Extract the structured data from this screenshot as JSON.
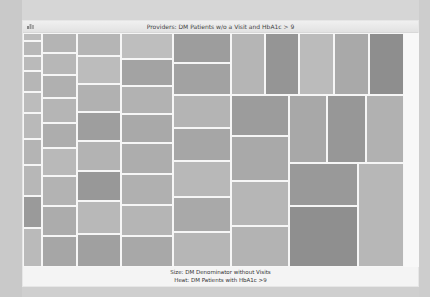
{
  "window": {
    "title": "Providers: DM Patients w/o a Visit and HbA1c > 9",
    "icon": "chart-window-icon"
  },
  "caption": {
    "size_label": "Size: DM Denominator without Visits",
    "heat_label": "Heat: DM Patients with HbA1c >9"
  },
  "chart_data": {
    "type": "heatmap",
    "subtype": "treemap",
    "title": "Providers: DM Patients w/o a Visit and HbA1c > 9",
    "size_measure": "DM Denominator without Visits",
    "color_measure": "DM Patients with HbA1c >9",
    "color_scale": "grayscale (darker = higher)",
    "legend": "none",
    "grid": false,
    "tiles": [
      {
        "x": 0,
        "y": 0,
        "w": 19,
        "h": 8,
        "c": "#bdbdbd"
      },
      {
        "x": 0,
        "y": 8,
        "w": 19,
        "h": 15,
        "c": "#b8b8b8"
      },
      {
        "x": 0,
        "y": 23,
        "w": 19,
        "h": 15,
        "c": "#bababa"
      },
      {
        "x": 0,
        "y": 38,
        "w": 19,
        "h": 21,
        "c": "#b6b6b6"
      },
      {
        "x": 0,
        "y": 59,
        "w": 19,
        "h": 21,
        "c": "#bcbcbc"
      },
      {
        "x": 0,
        "y": 80,
        "w": 19,
        "h": 26,
        "c": "#b9b9b9"
      },
      {
        "x": 0,
        "y": 106,
        "w": 19,
        "h": 26,
        "c": "#b4b4b4"
      },
      {
        "x": 0,
        "y": 132,
        "w": 19,
        "h": 31,
        "c": "#b7b7b7"
      },
      {
        "x": 0,
        "y": 163,
        "w": 19,
        "h": 32,
        "c": "#9a9a9a"
      },
      {
        "x": 0,
        "y": 195,
        "w": 19,
        "h": 39,
        "c": "#bababa"
      },
      {
        "x": 19,
        "y": 0,
        "w": 35,
        "h": 20,
        "c": "#b4b4b4"
      },
      {
        "x": 19,
        "y": 20,
        "w": 35,
        "h": 22,
        "c": "#b7b7b7"
      },
      {
        "x": 19,
        "y": 42,
        "w": 35,
        "h": 23,
        "c": "#b0b0b0"
      },
      {
        "x": 19,
        "y": 65,
        "w": 35,
        "h": 25,
        "c": "#b5b5b5"
      },
      {
        "x": 19,
        "y": 90,
        "w": 35,
        "h": 25,
        "c": "#adadad"
      },
      {
        "x": 19,
        "y": 115,
        "w": 35,
        "h": 28,
        "c": "#b9b9b9"
      },
      {
        "x": 19,
        "y": 143,
        "w": 35,
        "h": 30,
        "c": "#b3b3b3"
      },
      {
        "x": 19,
        "y": 173,
        "w": 35,
        "h": 30,
        "c": "#acacac"
      },
      {
        "x": 19,
        "y": 203,
        "w": 35,
        "h": 31,
        "c": "#a6a6a6"
      },
      {
        "x": 54,
        "y": 0,
        "w": 44,
        "h": 23,
        "c": "#b5b5b5"
      },
      {
        "x": 54,
        "y": 23,
        "w": 44,
        "h": 28,
        "c": "#bcbcbc"
      },
      {
        "x": 54,
        "y": 51,
        "w": 44,
        "h": 28,
        "c": "#b1b1b1"
      },
      {
        "x": 54,
        "y": 79,
        "w": 44,
        "h": 29,
        "c": "#9e9e9e"
      },
      {
        "x": 54,
        "y": 108,
        "w": 44,
        "h": 30,
        "c": "#b3b3b3"
      },
      {
        "x": 54,
        "y": 138,
        "w": 44,
        "h": 30,
        "c": "#989898"
      },
      {
        "x": 54,
        "y": 168,
        "w": 44,
        "h": 33,
        "c": "#b8b8b8"
      },
      {
        "x": 54,
        "y": 201,
        "w": 44,
        "h": 33,
        "c": "#a0a0a0"
      },
      {
        "x": 98,
        "y": 0,
        "w": 52,
        "h": 26,
        "c": "#bebebe"
      },
      {
        "x": 98,
        "y": 26,
        "w": 52,
        "h": 27,
        "c": "#a3a3a3"
      },
      {
        "x": 98,
        "y": 53,
        "w": 52,
        "h": 28,
        "c": "#b2b2b2"
      },
      {
        "x": 98,
        "y": 81,
        "w": 52,
        "h": 29,
        "c": "#a9a9a9"
      },
      {
        "x": 98,
        "y": 110,
        "w": 52,
        "h": 31,
        "c": "#adadad"
      },
      {
        "x": 98,
        "y": 141,
        "w": 52,
        "h": 31,
        "c": "#b0b0b0"
      },
      {
        "x": 98,
        "y": 172,
        "w": 52,
        "h": 31,
        "c": "#b5b5b5"
      },
      {
        "x": 98,
        "y": 203,
        "w": 52,
        "h": 31,
        "c": "#a8a8a8"
      },
      {
        "x": 150,
        "y": 0,
        "w": 58,
        "h": 30,
        "c": "#9d9d9d"
      },
      {
        "x": 150,
        "y": 30,
        "w": 58,
        "h": 32,
        "c": "#a2a2a2"
      },
      {
        "x": 150,
        "y": 62,
        "w": 58,
        "h": 33,
        "c": "#b4b4b4"
      },
      {
        "x": 150,
        "y": 95,
        "w": 58,
        "h": 33,
        "c": "#a6a6a6"
      },
      {
        "x": 150,
        "y": 128,
        "w": 58,
        "h": 36,
        "c": "#b8b8b8"
      },
      {
        "x": 150,
        "y": 164,
        "w": 58,
        "h": 35,
        "c": "#a9a9a9"
      },
      {
        "x": 150,
        "y": 199,
        "w": 58,
        "h": 35,
        "c": "#b6b6b6"
      },
      {
        "x": 208,
        "y": 0,
        "w": 34,
        "h": 62,
        "c": "#b5b5b5"
      },
      {
        "x": 242,
        "y": 0,
        "w": 34,
        "h": 62,
        "c": "#959595"
      },
      {
        "x": 276,
        "y": 0,
        "w": 35,
        "h": 62,
        "c": "#bbbbbb"
      },
      {
        "x": 311,
        "y": 0,
        "w": 35,
        "h": 62,
        "c": "#a9a9a9"
      },
      {
        "x": 346,
        "y": 0,
        "w": 35,
        "h": 62,
        "c": "#8e8e8e"
      },
      {
        "x": 208,
        "y": 62,
        "w": 58,
        "h": 41,
        "c": "#9c9c9c"
      },
      {
        "x": 208,
        "y": 103,
        "w": 58,
        "h": 45,
        "c": "#a9a9a9"
      },
      {
        "x": 208,
        "y": 148,
        "w": 58,
        "h": 45,
        "c": "#b6b6b6"
      },
      {
        "x": 208,
        "y": 193,
        "w": 58,
        "h": 41,
        "c": "#b3b3b3"
      },
      {
        "x": 266,
        "y": 62,
        "w": 38,
        "h": 68,
        "c": "#a8a8a8"
      },
      {
        "x": 304,
        "y": 62,
        "w": 39,
        "h": 68,
        "c": "#979797"
      },
      {
        "x": 343,
        "y": 62,
        "w": 38,
        "h": 68,
        "c": "#b1b1b1"
      },
      {
        "x": 266,
        "y": 130,
        "w": 69,
        "h": 43,
        "c": "#999999"
      },
      {
        "x": 266,
        "y": 173,
        "w": 69,
        "h": 61,
        "c": "#8f8f8f"
      },
      {
        "x": 335,
        "y": 130,
        "w": 46,
        "h": 104,
        "c": "#b7b7b7"
      }
    ]
  }
}
